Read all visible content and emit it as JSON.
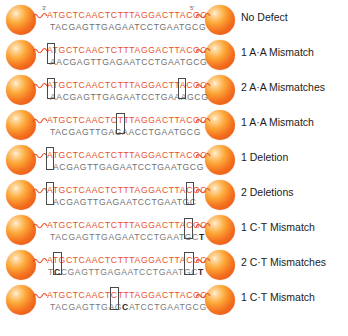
{
  "figure": {
    "colors": {
      "top_strand": "#e8502a",
      "bottom_strand": "#6f6f6f",
      "bead": "#f4701f",
      "bead_highlight": "#fff3e0",
      "box_outline": "#4a4a4a",
      "label_text": "#1b1b1b",
      "background": "#ffffff"
    },
    "prime_labels": {
      "left": "3'",
      "right": "5'"
    },
    "linker_icon": "squiggle-linker-icon",
    "bead_icon": "nanoparticle-sphere-icon",
    "rows": [
      {
        "id": "row-1",
        "label": "No Defect",
        "top_sequence": "ATGCTCAACTCTTTAGGACTTACGC",
        "bottom_sequence": "TACGAGTTGAGAATCCTGAATGCG",
        "defects": []
      },
      {
        "id": "row-2",
        "label": "1 A·A Mismatch",
        "top_sequence": "ATGCTCAACTCTTTAGGACTTACGC",
        "bottom_sequence": "AACGAGTTGAGAATCCTGAATGCG",
        "defects": [
          {
            "type": "mismatch",
            "position": 1,
            "top_base": "A",
            "bottom_base": "A"
          }
        ]
      },
      {
        "id": "row-3",
        "label": "2 A·A Mismatches",
        "top_sequence": "ATGCTCAACTCTTTAGGACTTACGC",
        "bottom_sequence": "AACGAGTTGAGAATCCTGAAAGCG",
        "defects": [
          {
            "type": "mismatch",
            "position": 1,
            "top_base": "A",
            "bottom_base": "A"
          },
          {
            "type": "mismatch",
            "position": 21,
            "top_base": "A",
            "bottom_base": "A"
          }
        ]
      },
      {
        "id": "row-4",
        "label": "1 A·A Mismatch",
        "top_sequence": "ATGCTCAACTCTTTAGGACTTACGC",
        "bottom_sequence": "TACGAGTTGAGAACCTGAATGCG",
        "defects": [
          {
            "type": "mismatch",
            "position": 13,
            "top_base": "T",
            "bottom_base": "A"
          }
        ]
      },
      {
        "id": "row-5",
        "label": "1 Deletion",
        "top_sequence": "ATGCTCAACTCTTTAGGACTTACGC",
        "bottom_sequence": "ACGAGTTGAGAATCCTGAATGCG",
        "defects": [
          {
            "type": "deletion",
            "position": 1,
            "top_base": "A",
            "bottom_base": ""
          }
        ]
      },
      {
        "id": "row-6",
        "label": "2 Deletions",
        "top_sequence": "ATGCTCAACTCTTTAGGACTTACGC",
        "bottom_sequence": "ACGAGTTGAGAATCCTGAATGC",
        "defects": [
          {
            "type": "deletion",
            "position": 1,
            "top_base": "A",
            "bottom_base": ""
          },
          {
            "type": "deletion",
            "position": 24,
            "top_base": "C",
            "bottom_base": ""
          }
        ]
      },
      {
        "id": "row-7",
        "label": "1 C·T Mismatch",
        "top_sequence": "ATGCTCAACTCTTTAGGACTTACGC",
        "bottom_sequence": "TACGAGTTGAGAATCCTGAATGCT",
        "defects": [
          {
            "type": "mismatch",
            "position": 24,
            "top_base": "C",
            "bottom_base": "T"
          }
        ]
      },
      {
        "id": "row-8",
        "label": "2 C·T  Mismatches",
        "top_sequence": "ATGCTCAACTCTTTAGGACTTACGC",
        "bottom_sequence": "TCCGAGTTGAGAATCCTGAATGCT",
        "defects": [
          {
            "type": "mismatch",
            "position": 2,
            "top_base": "T",
            "bottom_base": "C"
          },
          {
            "type": "mismatch",
            "position": 24,
            "top_base": "C",
            "bottom_base": "T"
          }
        ]
      },
      {
        "id": "row-9",
        "label": "1 C·T Mismatch",
        "top_sequence": "ATGCTCAACTCTTTAGGACTTACGC",
        "bottom_sequence": "TACGAGTTGAGCATCCTGAATGCG",
        "defects": [
          {
            "type": "mismatch",
            "position": 12,
            "top_base": "T",
            "bottom_base": "C"
          }
        ]
      }
    ]
  }
}
